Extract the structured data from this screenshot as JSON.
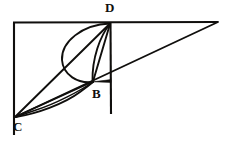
{
  "figure": {
    "type": "line-drawing",
    "canvas": {
      "width": 230,
      "height": 147,
      "background": "#ffffff"
    },
    "ink_color": "#100f0d",
    "labels": [
      {
        "id": "D",
        "text": "D",
        "x": 110,
        "y": 8
      },
      {
        "id": "B",
        "text": "B",
        "x": 97,
        "y": 94
      },
      {
        "id": "C",
        "text": "C",
        "x": 18,
        "y": 127
      }
    ],
    "points": {
      "D": {
        "x": 110,
        "y": 23
      },
      "B": {
        "x": 93,
        "y": 82
      },
      "C": {
        "x": 15,
        "y": 117
      },
      "A": {
        "x": 14,
        "y": 23
      },
      "E": {
        "x": 218,
        "y": 22
      },
      "F": {
        "x": 111,
        "y": 114
      },
      "G": {
        "x": 14,
        "y": 135
      },
      "Bt": {
        "x": 111,
        "y": 80
      }
    },
    "segments": [
      {
        "name": "left-vertical-frame",
        "from": "A",
        "to": "G"
      },
      {
        "name": "top-horizontal-frame",
        "from": "A",
        "to": "E"
      },
      {
        "name": "vertical-through-D",
        "from": "D",
        "to": "F"
      },
      {
        "name": "chord-C-to-D",
        "from": "C",
        "to": "D"
      },
      {
        "name": "chord-C-to-B",
        "from": "C",
        "to": "B"
      },
      {
        "name": "chord-B-to-D",
        "from": "B",
        "to": "D"
      },
      {
        "name": "diagonal-C-to-E",
        "from": "C",
        "to": "E"
      },
      {
        "name": "tick-B-to-vertical",
        "from": "B",
        "to": "Bt"
      }
    ],
    "arcs": [
      {
        "name": "outer-arc-D-to-B",
        "from": "D",
        "to": "B",
        "bulge": "left"
      },
      {
        "name": "inner-arc-D-to-B",
        "from": "D",
        "to": "B",
        "bulge": "left-small"
      },
      {
        "name": "arc-C-to-B",
        "from": "C",
        "to": "B",
        "bulge": "down"
      },
      {
        "name": "arc-lower-B-cusp",
        "from": "B",
        "to": "C",
        "bulge": "down-small"
      }
    ]
  }
}
